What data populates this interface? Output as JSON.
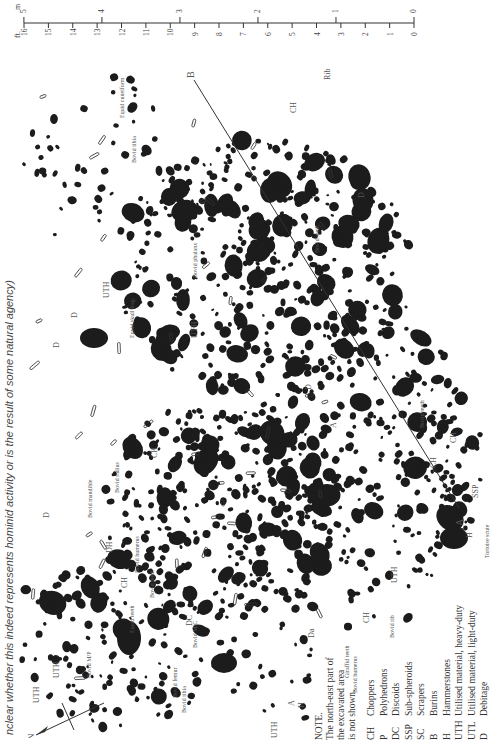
{
  "caption": "nclear whether this indeed represents hominid activity or is the result of some natural agency)",
  "scale_bar": {
    "metres_label": "m",
    "feet_label": "ft.",
    "metres": [
      "5",
      "4",
      "3",
      "2",
      "1",
      "0"
    ],
    "feet": [
      "16",
      "15",
      "14",
      "13",
      "12",
      "11",
      "10",
      "9",
      "8",
      "7",
      "6",
      "5",
      "4",
      "3",
      "2",
      "1",
      "0"
    ]
  },
  "section_line": {
    "start_label": "A",
    "end_label": "B"
  },
  "north_label": "N",
  "note": {
    "heading": "NOTE.",
    "lines": [
      "The north-east part of",
      "the excavated area",
      "is not shown."
    ]
  },
  "legend": [
    {
      "code": "CH",
      "meaning": "Choppers"
    },
    {
      "code": "P",
      "meaning": "Polyhedrons"
    },
    {
      "code": "DC",
      "meaning": "Discoids"
    },
    {
      "code": "SSP",
      "meaning": "Sub-spheroids"
    },
    {
      "code": "SC",
      "meaning": "Scrapers"
    },
    {
      "code": "B",
      "meaning": "Burins"
    },
    {
      "code": "H",
      "meaning": "Hammerstones"
    },
    {
      "code": "UTH",
      "meaning": "Utilised material, heavy-duty"
    },
    {
      "code": "UTL",
      "meaning": "Utilised material, light-duty"
    },
    {
      "code": "D",
      "meaning": "Debitage"
    }
  ],
  "map_labels": [
    {
      "text": "CH",
      "x": 282,
      "y": 75
    },
    {
      "text": "Rib",
      "x": 316,
      "y": 42
    },
    {
      "text": "Equid cuneiform",
      "x": 110,
      "y": 80
    },
    {
      "text": "Bovid tibia",
      "x": 122,
      "y": 125
    },
    {
      "text": "UTH",
      "x": 95,
      "y": 260
    },
    {
      "text": "Equid skull frag.",
      "x": 120,
      "y": 300
    },
    {
      "text": "UTH",
      "x": 183,
      "y": 300
    },
    {
      "text": "Bovid phalanx",
      "x": 183,
      "y": 240
    },
    {
      "text": "Bovid teeth",
      "x": 305,
      "y": 215
    },
    {
      "text": "D",
      "x": 350,
      "y": 160
    },
    {
      "text": "D",
      "x": 63,
      "y": 280
    },
    {
      "text": "D",
      "x": 45,
      "y": 310
    },
    {
      "text": "CH",
      "x": 143,
      "y": 420
    },
    {
      "text": "A",
      "x": 322,
      "y": 390
    },
    {
      "text": "D",
      "x": 297,
      "y": 352
    },
    {
      "text": "Bovid teeth",
      "x": 410,
      "y": 390
    },
    {
      "text": "CH",
      "x": 422,
      "y": 430
    },
    {
      "text": "CH",
      "x": 442,
      "y": 405
    },
    {
      "text": "SSP",
      "x": 464,
      "y": 460
    },
    {
      "text": "H",
      "x": 458,
      "y": 500
    },
    {
      "text": "Tortoise scute",
      "x": 475,
      "y": 520
    },
    {
      "text": "UTH",
      "x": 383,
      "y": 545
    },
    {
      "text": "Bovid rib",
      "x": 380,
      "y": 600
    },
    {
      "text": "CH",
      "x": 355,
      "y": 585
    },
    {
      "text": "Giraffid teeth",
      "x": 335,
      "y": 640
    },
    {
      "text": "Bovid humerus",
      "x": 343,
      "y": 655
    },
    {
      "text": "Da",
      "x": 300,
      "y": 600
    },
    {
      "text": "D",
      "x": 35,
      "y": 480
    },
    {
      "text": "Bovid mandible",
      "x": 78,
      "y": 480
    },
    {
      "text": "Bovid radius",
      "x": 105,
      "y": 455
    },
    {
      "text": "DH",
      "x": 98,
      "y": 515
    },
    {
      "text": "CH",
      "x": 113,
      "y": 550
    },
    {
      "text": "Bovid humerus",
      "x": 125,
      "y": 535
    },
    {
      "text": "Bovid teeth",
      "x": 140,
      "y": 560
    },
    {
      "text": "Equid teeth",
      "x": 120,
      "y": 595
    },
    {
      "text": "DC",
      "x": 178,
      "y": 588
    },
    {
      "text": "Bovid M/C",
      "x": 183,
      "y": 610
    },
    {
      "text": "UTH",
      "x": 25,
      "y": 665
    },
    {
      "text": "UTH",
      "x": 45,
      "y": 640
    },
    {
      "text": "Bovid M/P",
      "x": 77,
      "y": 640
    },
    {
      "text": "Bovid femur",
      "x": 163,
      "y": 660
    },
    {
      "text": "Bovid tibia",
      "x": 172,
      "y": 675
    },
    {
      "text": "UTH",
      "x": 263,
      "y": 700
    },
    {
      "text": "H",
      "x": 290,
      "y": 670
    },
    {
      "text": "A",
      "x": 280,
      "y": 668
    }
  ],
  "colors": {
    "ink": "#1c1c1c",
    "label": "#555555",
    "paper": "#ffffff"
  }
}
